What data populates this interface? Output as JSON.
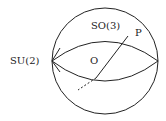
{
  "diagram": {
    "labels": {
      "sphere": "SO(3)",
      "equator": "SU(2)",
      "origin": "O",
      "point": "P"
    },
    "colors": {
      "stroke": "#222222",
      "background": "#ffffff"
    }
  }
}
